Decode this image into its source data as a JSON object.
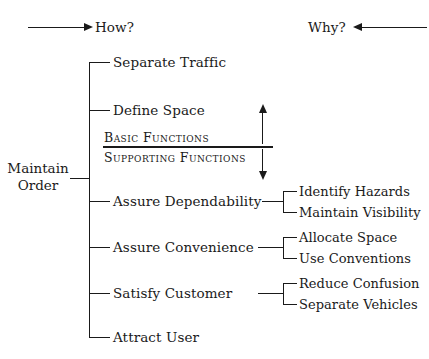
{
  "diagram": {
    "title_absent": true,
    "background_color": "#ffffff",
    "line_color": "#1a1a1a",
    "header": {
      "left_label": "How?",
      "left_arrow_direction": "right",
      "right_label": "Why?",
      "right_arrow_direction": "left"
    },
    "root": {
      "line1": "Maintain",
      "line2": "Order"
    },
    "band": {
      "basic": "Basic Functions",
      "supporting": "Supporting Functions",
      "divider": true,
      "scale_arrow": "double-headed-vertical"
    },
    "branches": [
      {
        "label": "Separate Traffic",
        "children": []
      },
      {
        "label": "Define Space",
        "children": []
      },
      {
        "label": "Assure Dependability",
        "children": [
          "Identify Hazards",
          "Maintain Visibility"
        ]
      },
      {
        "label": "Assure Convenience",
        "children": [
          "Allocate Space",
          "Use Conventions"
        ]
      },
      {
        "label": "Satisfy Customer",
        "children": [
          "Reduce Confusion",
          "Separate Vehicles"
        ]
      },
      {
        "label": "Attract User",
        "children": []
      }
    ]
  }
}
